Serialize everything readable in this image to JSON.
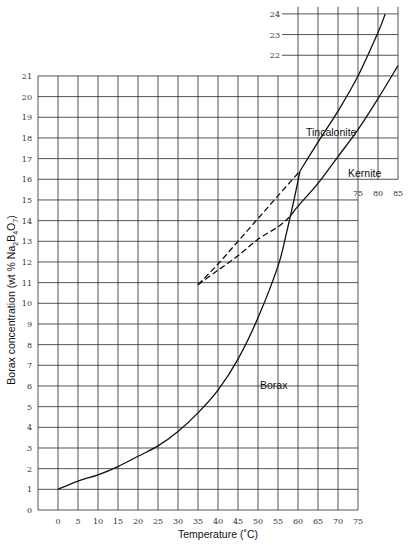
{
  "chart_data": {
    "type": "line",
    "title": "",
    "xlabel": "Temperature (°C)",
    "ylabel": "Borax concentration (wt % Na2B4O7)",
    "xlim": [
      -5,
      85
    ],
    "ylim": [
      0,
      24
    ],
    "grid": true,
    "x_ticks_main": [
      0,
      5,
      10,
      15,
      20,
      25,
      30,
      35,
      40,
      45,
      50,
      55,
      60,
      65,
      70,
      75
    ],
    "x_ticks_inset": [
      75,
      80,
      85
    ],
    "y_ticks_main": [
      0,
      1,
      2,
      3,
      4,
      5,
      6,
      7,
      8,
      9,
      10,
      11,
      12,
      13,
      14,
      15,
      16,
      17,
      18,
      19,
      20,
      21
    ],
    "y_ticks_inset": [
      22,
      23,
      24
    ],
    "series": [
      {
        "name": "Borax",
        "style": "solid",
        "x": [
          0,
          5,
          10,
          15,
          20,
          25,
          30,
          35,
          40,
          45,
          50,
          55,
          57,
          59,
          60.5
        ],
        "y": [
          1.0,
          1.4,
          1.7,
          2.1,
          2.6,
          3.1,
          3.8,
          4.7,
          5.8,
          7.3,
          9.3,
          11.8,
          13.3,
          15.0,
          16.4
        ]
      },
      {
        "name": "Tincalonite",
        "style": "solid",
        "x": [
          60.5,
          65,
          70,
          75,
          80,
          81.8
        ],
        "y": [
          16.4,
          17.8,
          19.3,
          21.0,
          23.1,
          24.0
        ]
      },
      {
        "name": "Tincalonite (metastable)",
        "style": "dashed",
        "x": [
          35,
          40,
          45,
          50,
          55,
          60.5
        ],
        "y": [
          10.9,
          11.9,
          13.0,
          14.1,
          15.2,
          16.4
        ]
      },
      {
        "name": "Kernite",
        "style": "solid",
        "x": [
          58,
          60,
          65,
          70,
          75,
          80,
          85
        ],
        "y": [
          14.2,
          14.7,
          15.8,
          17.1,
          18.4,
          19.9,
          21.5
        ]
      },
      {
        "name": "Kernite (metastable)",
        "style": "dashed",
        "x": [
          35,
          40,
          45,
          50,
          55,
          58
        ],
        "y": [
          10.9,
          11.6,
          12.3,
          13.1,
          13.7,
          14.2
        ]
      }
    ],
    "annotations": [
      {
        "text": "Tincalonite",
        "x": 62,
        "y": 17.9
      },
      {
        "text": "Kernite",
        "x": 72.5,
        "y": 15.8
      },
      {
        "text": "Borax",
        "x": 50.5,
        "y": 6.1
      }
    ]
  },
  "labels": {
    "xlabel": "Temperature (˚C)",
    "ylabel_prefix": "Borax concentration (wt % Na",
    "ylabel_sub1": "2",
    "ylabel_mid": "B",
    "ylabel_sub2": "4",
    "ylabel_mid2": "O",
    "ylabel_sub3": "7",
    "ylabel_suffix": ")",
    "tincalonite": "Tincalonite",
    "kernite": "Kernite",
    "borax": "Borax"
  },
  "colors": {
    "line": "#111111",
    "grid": "#2a2a2a",
    "background": "#ffffff"
  }
}
